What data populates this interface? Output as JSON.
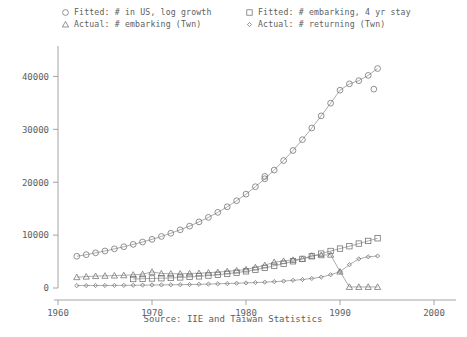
{
  "chart_data": {
    "type": "line",
    "title": "",
    "subtitle": "",
    "xlabel": "",
    "ylabel": "",
    "caption": "Source: IIE and Taiwan Statistics",
    "xlim": [
      1960,
      2000
    ],
    "ylim": [
      0,
      45000
    ],
    "xticks": [
      1960,
      1970,
      1980,
      1990,
      2000
    ],
    "xtick_labels": [
      "1960",
      "1970",
      "1980",
      "1990",
      "2000"
    ],
    "yticks": [
      0,
      10000,
      20000,
      30000,
      40000
    ],
    "ytick_labels": [
      "0",
      "10000",
      "20000",
      "30000",
      "40000"
    ],
    "grid": false,
    "legend_position": "top",
    "series": [
      {
        "name": "Fitted: # in US, log growth",
        "marker": "circle",
        "x": [
          1962,
          1963,
          1964,
          1965,
          1966,
          1967,
          1968,
          1969,
          1970,
          1971,
          1972,
          1973,
          1974,
          1975,
          1976,
          1977,
          1978,
          1979,
          1980,
          1981,
          1982,
          1983,
          1984,
          1985,
          1986,
          1987,
          1988,
          1989,
          1990,
          1991,
          1992,
          1993,
          1994
        ],
        "values": [
          6000,
          6300,
          6650,
          7000,
          7400,
          7800,
          8250,
          8700,
          9200,
          9750,
          10350,
          11000,
          11700,
          12500,
          13350,
          14300,
          15350,
          16500,
          17750,
          19150,
          20650,
          22300,
          24100,
          26000,
          28050,
          30250,
          32550,
          34950,
          37400,
          38600,
          39200,
          40200,
          41500
        ]
      },
      {
        "name": "Actual: # embarking (Twn)",
        "marker": "triangle",
        "x": [
          1962,
          1963,
          1964,
          1965,
          1966,
          1967,
          1968,
          1969,
          1970,
          1971,
          1972,
          1973,
          1974,
          1975,
          1976,
          1977,
          1978,
          1979,
          1980,
          1981,
          1982,
          1983,
          1984,
          1985,
          1986,
          1987,
          1988,
          1989,
          1990,
          1991,
          1992,
          1993,
          1994
        ],
        "values": [
          2050,
          2150,
          2250,
          2300,
          2350,
          2400,
          2500,
          2600,
          3050,
          2750,
          2700,
          2700,
          2750,
          2800,
          2900,
          3000,
          3150,
          3300,
          3500,
          3900,
          4300,
          4900,
          5100,
          5300,
          5500,
          6100,
          6200,
          6300,
          3100,
          200,
          200,
          200,
          200
        ]
      },
      {
        "name": "Fitted: # embarking, 4 yr stay",
        "marker": "square",
        "x": [
          1968,
          1969,
          1970,
          1971,
          1972,
          1973,
          1974,
          1975,
          1976,
          1977,
          1978,
          1979,
          1980,
          1981,
          1982,
          1983,
          1984,
          1985,
          1986,
          1987,
          1988,
          1989,
          1990,
          1991,
          1992,
          1993,
          1994
        ],
        "values": [
          1700,
          1750,
          1800,
          1850,
          1900,
          2000,
          2100,
          2200,
          2350,
          2500,
          2700,
          2900,
          3150,
          3450,
          3800,
          4200,
          4600,
          5050,
          5500,
          6000,
          6500,
          7000,
          7450,
          7900,
          8400,
          8900,
          9400
        ]
      },
      {
        "name": "Actual: # returning (Twn)",
        "marker": "diamond",
        "x": [
          1962,
          1963,
          1964,
          1965,
          1966,
          1967,
          1968,
          1969,
          1970,
          1971,
          1972,
          1973,
          1974,
          1975,
          1976,
          1977,
          1978,
          1979,
          1980,
          1981,
          1982,
          1983,
          1984,
          1985,
          1986,
          1987,
          1988,
          1989,
          1990,
          1991,
          1992,
          1993,
          1994
        ],
        "values": [
          450,
          460,
          470,
          480,
          490,
          500,
          520,
          540,
          560,
          580,
          600,
          630,
          660,
          700,
          740,
          790,
          840,
          900,
          960,
          1030,
          1100,
          1200,
          1300,
          1450,
          1600,
          1800,
          2050,
          2500,
          3100,
          4400,
          5500,
          5900,
          6050
        ]
      }
    ],
    "outliers": [
      {
        "series": "Fitted: # in US, log growth",
        "marker": "circle",
        "x": 1982,
        "value": 21100
      },
      {
        "series": "Fitted: # in US, log growth",
        "marker": "circle",
        "x": 1993.6,
        "value": 37600
      }
    ],
    "colors": {
      "line": "#8a8a8a",
      "marker": "#6e6e6e",
      "axis": "#9a9a9a",
      "text": "#5e5e5e",
      "background": "#ffffff"
    }
  },
  "legend": {
    "entries": [
      {
        "marker": "circle",
        "label": "Fitted: # in US, log growth"
      },
      {
        "marker": "triangle",
        "label": "Actual: # embarking (Twn)"
      },
      {
        "marker": "square",
        "label": "Fitted: # embarking, 4 yr stay"
      },
      {
        "marker": "diamond",
        "label": "Actual: # returning (Twn)"
      }
    ]
  }
}
